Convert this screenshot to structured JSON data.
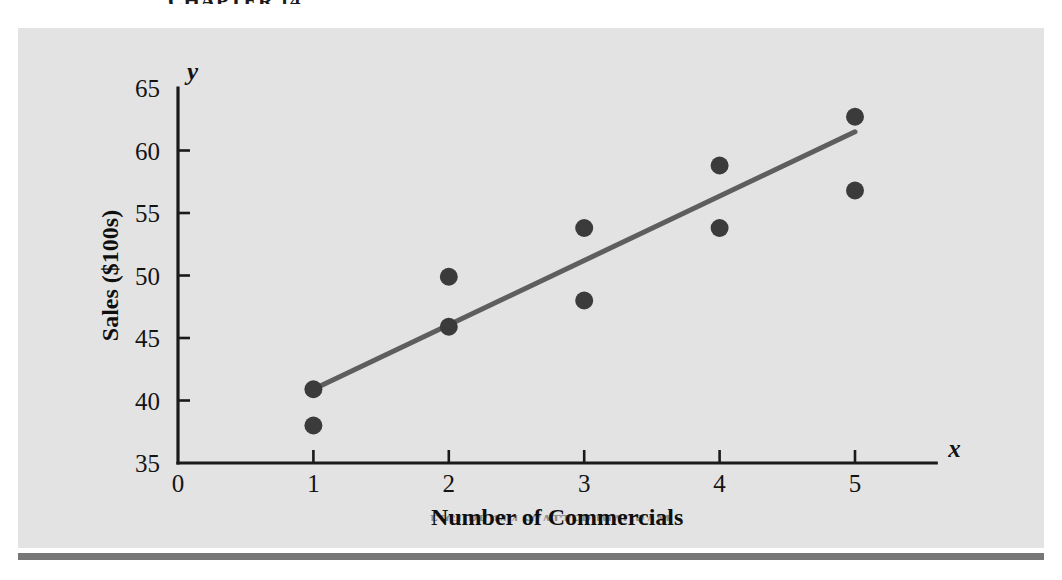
{
  "page": {
    "top_caption": "CHAPTER 14",
    "bottom_caption": "FIGURE 14.4  SCATTER DIAGRAM",
    "panel_background": "#e3e3e3",
    "rule_color": "#777777"
  },
  "chart_data": {
    "type": "scatter",
    "title": "",
    "xlabel": "Number of Commercials",
    "ylabel": "Sales ($100s)",
    "x_axis_variable": "x",
    "y_axis_variable": "y",
    "xlim": [
      0,
      5.6
    ],
    "ylim": [
      35,
      65
    ],
    "xticks": [
      0,
      1,
      2,
      3,
      4,
      5
    ],
    "xtick_labels": [
      "0",
      "1",
      "2",
      "3",
      "4",
      "5"
    ],
    "yticks": [
      35,
      40,
      45,
      50,
      55,
      60,
      65
    ],
    "ytick_labels": [
      "35",
      "40",
      "45",
      "50",
      "55",
      "60",
      "65"
    ],
    "grid": false,
    "legend": null,
    "marker_color": "#3b3b3b",
    "marker_size": 9,
    "points": [
      {
        "x": 1,
        "y": 40.9
      },
      {
        "x": 1,
        "y": 38.0
      },
      {
        "x": 2,
        "y": 49.9
      },
      {
        "x": 2,
        "y": 45.9
      },
      {
        "x": 3,
        "y": 53.8
      },
      {
        "x": 3,
        "y": 48.0
      },
      {
        "x": 4,
        "y": 58.8
      },
      {
        "x": 4,
        "y": 53.8
      },
      {
        "x": 5,
        "y": 62.7
      },
      {
        "x": 5,
        "y": 56.8
      }
    ],
    "series": [
      {
        "name": "Sales observations",
        "x": [
          1,
          1,
          2,
          2,
          3,
          3,
          4,
          4,
          5,
          5
        ],
        "values": [
          40.9,
          38.0,
          49.9,
          45.9,
          53.8,
          48.0,
          58.8,
          53.8,
          62.7,
          56.8
        ]
      }
    ],
    "trendline": {
      "type": "linear-regression",
      "color": "#5e5e5e",
      "x_start": 1,
      "y_start": 40.9,
      "x_end": 5,
      "y_end": 61.5,
      "slope": 5.15,
      "intercept": 35.75
    }
  }
}
